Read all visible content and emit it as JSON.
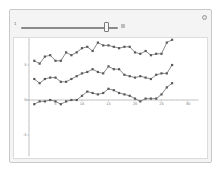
{
  "manipulate": {
    "slider": {
      "min_label": "1",
      "value": 27,
      "min": 1,
      "max": 30,
      "thumb_position_pct": 86
    },
    "icons": {
      "options": "circle-options-icon",
      "expander": "plus-expander-icon"
    }
  },
  "chart_data": {
    "type": "line",
    "title": "",
    "xlabel": "",
    "ylabel": "",
    "xlim": [
      0,
      32
    ],
    "ylim": [
      -8,
      9
    ],
    "x_ticks": [
      "5",
      "10",
      "15",
      "20",
      "25",
      "30"
    ],
    "y_ticks": [
      "5",
      "0",
      "-5"
    ],
    "grid": false,
    "legend": null,
    "x": [
      1,
      2,
      3,
      4,
      5,
      6,
      7,
      8,
      9,
      10,
      11,
      12,
      13,
      14,
      15,
      16,
      17,
      18,
      19,
      20,
      21,
      22,
      23,
      24,
      25,
      26,
      27
    ],
    "series": [
      {
        "name": "series-1",
        "color": "#5a5a5a",
        "values": [
          5.6,
          5.2,
          6.2,
          6.4,
          5.6,
          5.6,
          6.8,
          6.4,
          6.8,
          7.4,
          7.6,
          7.0,
          8.2,
          7.8,
          7.8,
          7.6,
          7.4,
          7.6,
          7.6,
          6.8,
          6.6,
          7.0,
          6.4,
          6.6,
          6.6,
          8.2,
          8.6
        ]
      },
      {
        "name": "series-2",
        "color": "#5a5a5a",
        "values": [
          3.0,
          2.4,
          3.0,
          3.2,
          3.2,
          2.6,
          2.6,
          3.0,
          3.4,
          3.8,
          4.0,
          4.4,
          4.0,
          3.8,
          4.8,
          4.4,
          4.4,
          3.6,
          3.4,
          3.2,
          3.4,
          3.2,
          3.0,
          3.6,
          3.8,
          3.8,
          5.0
        ]
      },
      {
        "name": "series-3",
        "color": "#5a5a5a",
        "values": [
          -0.6,
          -0.2,
          -0.2,
          0.0,
          -0.2,
          -0.6,
          -0.2,
          0.0,
          0.0,
          0.6,
          1.2,
          1.0,
          0.8,
          1.0,
          1.6,
          1.4,
          1.0,
          0.8,
          0.6,
          0.2,
          -0.2,
          0.2,
          0.2,
          0.2,
          0.8,
          1.8,
          2.4
        ]
      }
    ]
  }
}
